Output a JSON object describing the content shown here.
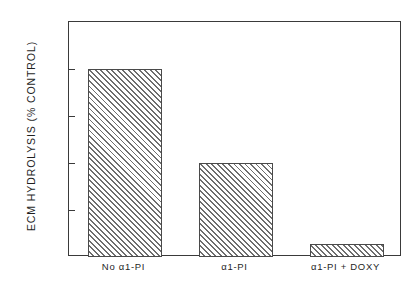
{
  "chart_data": {
    "type": "bar",
    "title": "",
    "xlabel": "",
    "ylabel": "ECM HYDROLYSIS (% CONTROL)",
    "categories": [
      "No α1-PI",
      "α1-PI",
      "α1-PI + DOXY"
    ],
    "values": [
      100,
      50,
      7
    ],
    "ylim": [
      0,
      125
    ],
    "yticks": [
      0,
      25,
      50,
      75,
      100,
      125
    ],
    "ytick_labels": [
      "0",
      "25",
      "50",
      "75",
      "100",
      "125"
    ],
    "grid": false,
    "legend": null,
    "bar_style": {
      "fill": "diagonal-hatch-45",
      "hatch_color": "#6e6e6e",
      "face_color": "#ffffff",
      "edge_color": "#4a4a4a"
    },
    "axis_color": "#3a3a3a",
    "background_color": "#ffffff"
  }
}
